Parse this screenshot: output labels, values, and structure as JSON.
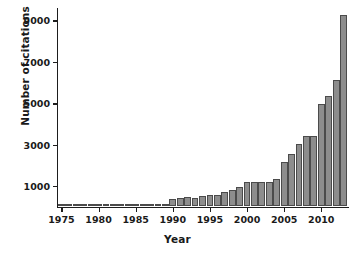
{
  "chart_data": {
    "type": "bar",
    "title": "",
    "xlabel": "Year",
    "ylabel": "Number of citations",
    "xlim": [
      1974.4,
      2013.6
    ],
    "ylim": [
      0,
      9600
    ],
    "grid": false,
    "legend": null,
    "xticks": [
      1975,
      1980,
      1985,
      1990,
      1995,
      2000,
      2005,
      2010
    ],
    "xtick_labels": [
      "1975",
      "1980",
      "1985",
      "1990",
      "1995",
      "2000",
      "2005",
      "2010"
    ],
    "yticks": [
      1000,
      3000,
      5000,
      7000,
      9000
    ],
    "ytick_labels": [
      "1000",
      "3000",
      "5000",
      "7000",
      "9000"
    ],
    "bar_color": "#8d8d8d",
    "bar_edge_color": "#4b4b4b",
    "axis_color": "#1d1d1d",
    "categories": [
      1975,
      1976,
      1977,
      1978,
      1979,
      1980,
      1981,
      1982,
      1983,
      1984,
      1985,
      1986,
      1987,
      1988,
      1989,
      1990,
      1991,
      1992,
      1993,
      1994,
      1995,
      1996,
      1997,
      1998,
      1999,
      2000,
      2001,
      2002,
      2003,
      2004,
      2005,
      2006,
      2007,
      2008,
      2009,
      2010,
      2011,
      2012,
      2013
    ],
    "values": [
      30,
      40,
      45,
      70,
      65,
      70,
      70,
      75,
      75,
      90,
      95,
      110,
      115,
      130,
      135,
      380,
      400,
      450,
      420,
      480,
      560,
      530,
      700,
      780,
      960,
      1180,
      1180,
      1180,
      1180,
      1310,
      2150,
      2550,
      3020,
      3420,
      3420,
      4920,
      5330,
      6090,
      9250
    ]
  },
  "axes": {
    "ylabel_text": "Number of citations",
    "xlabel_text": "Year"
  }
}
